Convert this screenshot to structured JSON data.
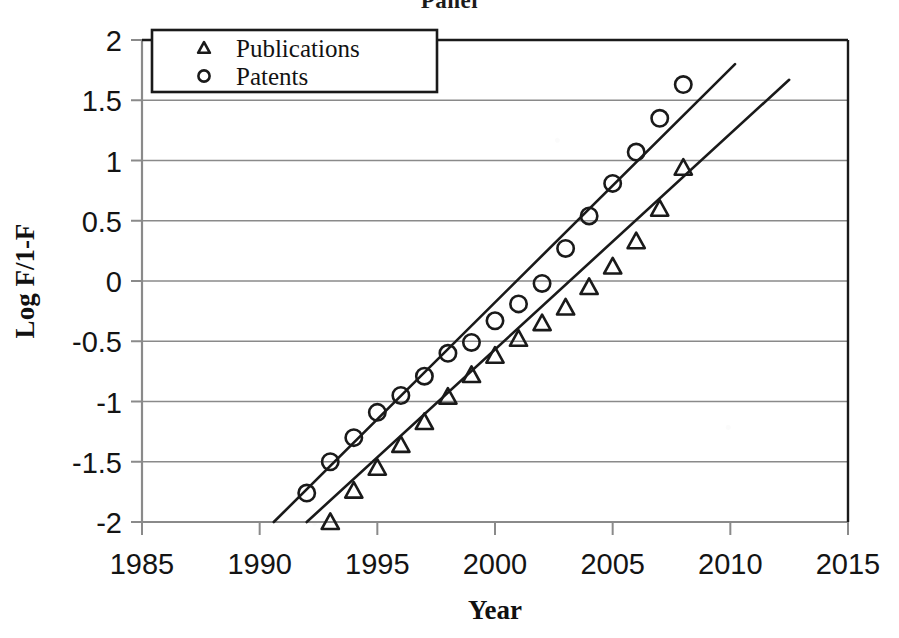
{
  "figure": {
    "clipped_title": "Panel",
    "background_color": "#ffffff",
    "ink_color": "#1a1a1a",
    "gridline_color": "#8a8a8a"
  },
  "axes": {
    "x_title": "Year",
    "y_title": "Log F/1-F",
    "x_ticks": [
      "1985",
      "1990",
      "1995",
      "2000",
      "2005",
      "2010",
      "2015"
    ],
    "y_ticks": [
      "2",
      "1.5",
      "1",
      "0.5",
      "0",
      "-0.5",
      "-1",
      "-1.5",
      "-2"
    ]
  },
  "legend": {
    "position": "top-left-inside",
    "entries": [
      {
        "label": "Publications",
        "marker": "triangle"
      },
      {
        "label": "Patents",
        "marker": "circle"
      }
    ]
  },
  "chart_data": {
    "type": "scatter",
    "title": "Panel",
    "xlabel": "Year",
    "ylabel": "Log F/1-F",
    "xlim": [
      1985,
      2015
    ],
    "ylim": [
      -2,
      2
    ],
    "xticks": [
      1985,
      1990,
      1995,
      2000,
      2005,
      2010,
      2015
    ],
    "yticks": [
      -2,
      -1.5,
      -1,
      -0.5,
      0,
      0.5,
      1,
      1.5,
      2
    ],
    "grid": "horizontal",
    "legend_position": "upper left",
    "series": [
      {
        "name": "Patents",
        "marker": "circle",
        "points": [
          {
            "x": 1992,
            "y": -1.76
          },
          {
            "x": 1993,
            "y": -1.5
          },
          {
            "x": 1994,
            "y": -1.3
          },
          {
            "x": 1995,
            "y": -1.09
          },
          {
            "x": 1996,
            "y": -0.95
          },
          {
            "x": 1997,
            "y": -0.79
          },
          {
            "x": 1998,
            "y": -0.6
          },
          {
            "x": 1999,
            "y": -0.51
          },
          {
            "x": 2000,
            "y": -0.33
          },
          {
            "x": 2001,
            "y": -0.19
          },
          {
            "x": 2002,
            "y": -0.02
          },
          {
            "x": 2003,
            "y": 0.27
          },
          {
            "x": 2004,
            "y": 0.54
          },
          {
            "x": 2005,
            "y": 0.81
          },
          {
            "x": 2006,
            "y": 1.07
          },
          {
            "x": 2007,
            "y": 1.35
          },
          {
            "x": 2008,
            "y": 1.63
          }
        ],
        "trendline": {
          "x0": 1990.6,
          "y0": -2.0,
          "x1": 2010.2,
          "y1": 1.8
        }
      },
      {
        "name": "Publications",
        "marker": "triangle",
        "points": [
          {
            "x": 1993,
            "y": -2.0
          },
          {
            "x": 1994,
            "y": -1.74
          },
          {
            "x": 1995,
            "y": -1.55
          },
          {
            "x": 1996,
            "y": -1.36
          },
          {
            "x": 1997,
            "y": -1.17
          },
          {
            "x": 1998,
            "y": -0.96
          },
          {
            "x": 1999,
            "y": -0.78
          },
          {
            "x": 2000,
            "y": -0.62
          },
          {
            "x": 2001,
            "y": -0.48
          },
          {
            "x": 2002,
            "y": -0.35
          },
          {
            "x": 2003,
            "y": -0.22
          },
          {
            "x": 2004,
            "y": -0.05
          },
          {
            "x": 2005,
            "y": 0.12
          },
          {
            "x": 2006,
            "y": 0.33
          },
          {
            "x": 2007,
            "y": 0.6
          },
          {
            "x": 2008,
            "y": 0.94
          }
        ],
        "trendline": {
          "x0": 1992.0,
          "y0": -2.0,
          "x1": 2012.5,
          "y1": 1.67
        }
      }
    ]
  }
}
